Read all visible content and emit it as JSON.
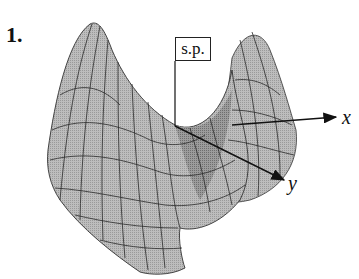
{
  "figure": {
    "number": "1.",
    "point_label": "s.p.",
    "axis_x": "x",
    "axis_y": "y",
    "surface_fill": "#b5b5b5",
    "surface_shade": "#8f8f8f",
    "mesh_color": "#2a2a2a"
  }
}
